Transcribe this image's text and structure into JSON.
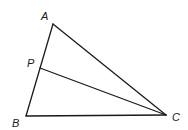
{
  "diagram": {
    "type": "geometry-triangle",
    "points": {
      "A": {
        "label": "A",
        "x": 53,
        "y": 24,
        "label_x": 41,
        "label_y": 20
      },
      "B": {
        "label": "B",
        "x": 26,
        "y": 116,
        "label_x": 12,
        "label_y": 127
      },
      "C": {
        "label": "C",
        "x": 166,
        "y": 115,
        "label_x": 172,
        "label_y": 121
      },
      "P": {
        "label": "P",
        "x": 40,
        "y": 68,
        "label_x": 27,
        "label_y": 67
      }
    },
    "segments": [
      {
        "from": "A",
        "to": "B"
      },
      {
        "from": "B",
        "to": "C"
      },
      {
        "from": "A",
        "to": "C"
      },
      {
        "from": "P",
        "to": "C"
      }
    ],
    "colors": {
      "stroke": "#1a1a1a",
      "background": "#ffffff"
    }
  }
}
